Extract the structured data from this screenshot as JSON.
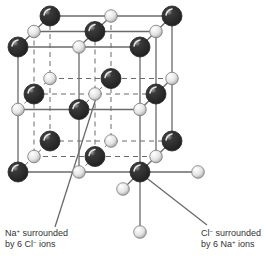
{
  "legend": {
    "na_color": "#3a3a3a",
    "cl_color": "#e4e4e4"
  },
  "labels": {
    "na": {
      "line1_prefix": "Na",
      "line1_sup": "+",
      "line1_suffix": " surrounded",
      "line2_prefix": "by 6 Cl",
      "line2_sup": "−",
      "line2_suffix": " ions"
    },
    "cl": {
      "line1_prefix": "Cl",
      "line1_sup": "−",
      "line1_suffix": " surrounded",
      "line2_prefix": "by 6 Na",
      "line2_sup": "+",
      "line2_suffix": " ions"
    }
  },
  "ions": [
    {
      "type": "Na"
    },
    {
      "type": "Cl"
    },
    {
      "type": "Na"
    },
    {
      "type": "Cl"
    },
    {
      "type": "Na"
    },
    {
      "type": "Cl"
    },
    {
      "type": "Na"
    },
    {
      "type": "Cl"
    },
    {
      "type": "Na"
    }
  ]
}
